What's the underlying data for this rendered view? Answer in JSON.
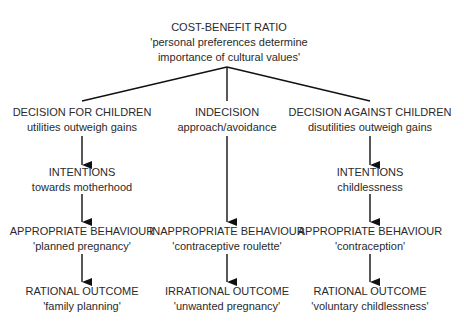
{
  "root": {
    "title": "COST-BENEFIT RATIO",
    "line1": "'personal preferences determine",
    "line2": "importance of cultural values'"
  },
  "columns": [
    {
      "decision": {
        "title": "DECISION FOR CHILDREN",
        "sub": "utilities outweigh gains"
      },
      "intentions": {
        "title": "INTENTIONS",
        "sub": "towards motherhood"
      },
      "behaviour": {
        "title": "APPROPRIATE BEHAVIOUR",
        "sub": "'planned pregnancy'"
      },
      "outcome": {
        "title": "RATIONAL OUTCOME",
        "sub": "'family planning'"
      }
    },
    {
      "decision": {
        "title": "INDECISION",
        "sub": "approach/avoidance"
      },
      "behaviour": {
        "title": "INAPPROPRIATE BEHAVIOUR",
        "sub": "'contraceptive roulette'"
      },
      "outcome": {
        "title": "IRRATIONAL OUTCOME",
        "sub": "'unwanted pregnancy'"
      }
    },
    {
      "decision": {
        "title": "DECISION AGAINST CHILDREN",
        "sub": "disutilities outweigh gains"
      },
      "intentions": {
        "title": "INTENTIONS",
        "sub": "childlessness"
      },
      "behaviour": {
        "title": "APPROPRIATE BEHAVIOUR",
        "sub": "'contraception'"
      },
      "outcome": {
        "title": "RATIONAL OUTCOME",
        "sub": "'voluntary childlessness'"
      }
    }
  ],
  "colors": {
    "line": "#111111",
    "text": "#2a2a2a",
    "background": "#ffffff"
  }
}
